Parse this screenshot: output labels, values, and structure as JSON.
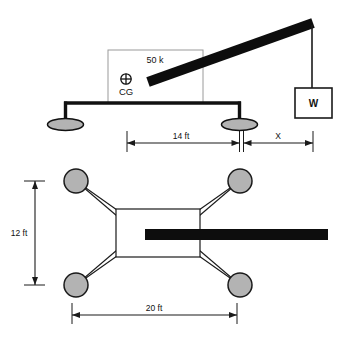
{
  "figure": {
    "title_text": "",
    "colors": {
      "background": "#ffffff",
      "boom": "#0d0d0d",
      "outline": "#1a1a1a",
      "pad_fill": "#b3b3b3",
      "body_fill": "#ffffff",
      "dimension_line": "#1a1a1a"
    }
  },
  "elevation_view": {
    "body": {
      "load_label": "50 k",
      "cg_symbol": "⊕",
      "cg_label": "CG"
    },
    "weight_box": {
      "label": "W"
    },
    "dimensions": [
      {
        "label": "14 ft",
        "value": 14,
        "unit": "ft"
      },
      {
        "label": "X",
        "value": null,
        "unit": ""
      }
    ]
  },
  "plan_view": {
    "dimensions": [
      {
        "label": "12 ft",
        "value": 12,
        "unit": "ft"
      },
      {
        "label": "20 ft",
        "value": 20,
        "unit": "ft"
      }
    ],
    "pad_count": 4
  }
}
